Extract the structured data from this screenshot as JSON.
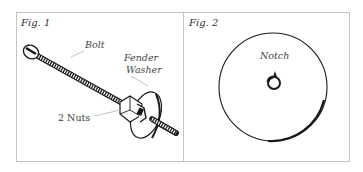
{
  "figures": [
    {
      "label": "Fig. 1",
      "callouts": {
        "bolt": "Bolt",
        "fender_washer_line1": "Fender",
        "fender_washer_line2": "Washer",
        "nuts": "2 Nuts"
      }
    },
    {
      "label": "Fig. 2",
      "callouts": {
        "notch": "Notch"
      }
    }
  ],
  "colors": {
    "border": "#c4c4c4",
    "ink": "#1a1a1a",
    "leader": "#9a9a9a"
  }
}
